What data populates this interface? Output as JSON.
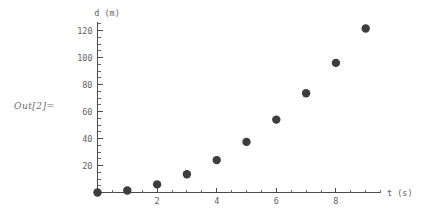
{
  "out_label": "Out[2]=",
  "accent_color": "#3d3d3d",
  "axis_color": "#4a4a4a",
  "text_color": "#5f5f5f",
  "chart_data": {
    "type": "scatter",
    "title": "",
    "xlabel": "t (s)",
    "ylabel": "d (m)",
    "x": [
      0,
      1,
      2,
      3,
      4,
      5,
      6,
      7,
      8,
      9
    ],
    "values": [
      0,
      1.5,
      6,
      13.5,
      24,
      37.5,
      54,
      73.5,
      96,
      121.5
    ],
    "series": [
      {
        "name": "d",
        "x": [
          0,
          1,
          2,
          3,
          4,
          5,
          6,
          7,
          8,
          9
        ],
        "values": [
          0,
          1.5,
          6,
          13.5,
          24,
          37.5,
          54,
          73.5,
          96,
          121.5
        ]
      }
    ],
    "xlim": [
      0,
      9.5
    ],
    "ylim": [
      0,
      126
    ],
    "xticks": [
      2,
      4,
      6,
      8
    ],
    "xtick_labels": [
      "2",
      "4",
      "6",
      "8"
    ],
    "yticks": [
      20,
      40,
      60,
      80,
      100,
      120
    ],
    "ytick_labels": [
      "20",
      "40",
      "60",
      "80",
      "100",
      "120"
    ],
    "x_minor_step": 0.5,
    "y_minor_step": 5,
    "grid": false,
    "legend": "none",
    "marker": "filled-circle",
    "marker_size": 5
  }
}
